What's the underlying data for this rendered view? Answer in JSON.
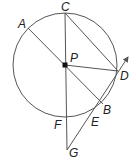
{
  "diagram": {
    "type": "circle-geometry",
    "circle": {
      "center_label": "P",
      "cx": 65,
      "cy": 65,
      "r": 52
    },
    "points": {
      "A": {
        "label": "A",
        "x": 28,
        "y": 28
      },
      "B": {
        "label": "B",
        "x": 102,
        "y": 103
      },
      "C": {
        "label": "C",
        "x": 65,
        "y": 13
      },
      "D": {
        "label": "D",
        "x": 118,
        "y": 71
      },
      "E": {
        "label": "E",
        "x": 94,
        "y": 116
      },
      "F": {
        "label": "F",
        "x": 65,
        "y": 117
      },
      "G": {
        "label": "G",
        "x": 67,
        "y": 150
      },
      "P": {
        "label": "P",
        "x": 65,
        "y": 65
      }
    },
    "segments": [
      "AB",
      "CG",
      "CD",
      "PD",
      "GD (ray beyond D)"
    ],
    "colors": {
      "line": "#555555",
      "text": "#222222",
      "background": "#ffffff"
    }
  }
}
